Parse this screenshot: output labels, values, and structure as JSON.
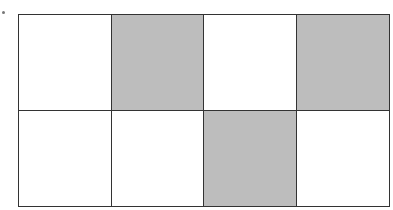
{
  "diagram": {
    "type": "shaded-grid",
    "rows": 2,
    "columns": 4,
    "shade_color": "#bdbdbd",
    "fill_color": "#ffffff",
    "border_color": "#333333",
    "cells": [
      [
        false,
        true,
        false,
        true
      ],
      [
        false,
        false,
        true,
        false
      ]
    ],
    "shaded_count": 3,
    "total_cells": 8
  }
}
